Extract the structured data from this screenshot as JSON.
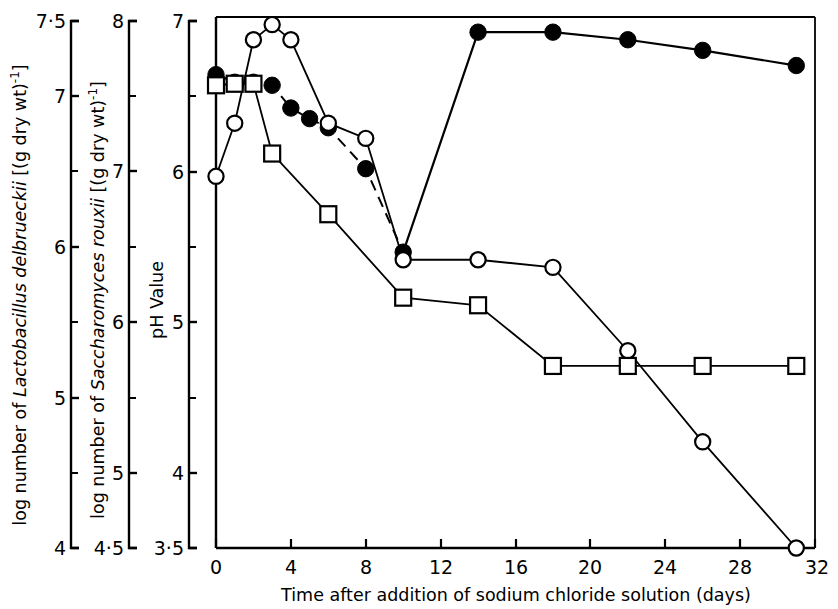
{
  "figure": {
    "background": "#ffffff",
    "ink": "#000000",
    "plot_frame": {
      "left": 216,
      "top": 17,
      "right": 815,
      "bottom": 548
    }
  },
  "axes": {
    "y1": {
      "title_parts": [
        "log number of ",
        "Lactobacillus delbrueckii",
        " [(g dry wt)",
        "-1",
        "]"
      ],
      "title_plain": "log number of Lactobacillus delbrueckii [(g dry wt)-1]",
      "ticks": [
        "7·5",
        "7",
        "6",
        "5",
        "4"
      ],
      "tick_values": [
        7.5,
        7,
        6,
        5,
        4
      ],
      "minor_ticks": [
        6.5,
        5.5,
        4.5
      ],
      "range": [
        4,
        7.5
      ]
    },
    "y2": {
      "title_parts": [
        "log number of ",
        "Saccharomyces rouxii",
        " [(g dry wt)",
        "-1",
        "]"
      ],
      "title_plain": "log number of Saccharomyces rouxii [(g dry wt)-1]",
      "ticks": [
        "8",
        "7",
        "6",
        "5",
        "4·5"
      ],
      "tick_values": [
        8,
        7,
        6,
        5,
        4.5
      ],
      "minor_ticks": [
        7.5,
        6.5,
        5.5
      ],
      "range": [
        4.5,
        8
      ]
    },
    "y3": {
      "title": "pH Value",
      "ticks": [
        "7",
        "6",
        "5",
        "4",
        "3·5"
      ],
      "tick_values": [
        7,
        6,
        5,
        4,
        3.5
      ],
      "minor_ticks": [
        6.5,
        5.5,
        4.5
      ],
      "range": [
        3.5,
        7
      ]
    },
    "x": {
      "title": "Time after addition of sodium chloride solution (days)",
      "ticks": [
        "0",
        "4",
        "8",
        "12",
        "16",
        "20",
        "24",
        "28",
        "32"
      ],
      "tick_values": [
        0,
        4,
        8,
        12,
        16,
        20,
        24,
        28,
        32
      ],
      "range": [
        0,
        32
      ]
    }
  },
  "chart_data": {
    "type": "line",
    "title": "",
    "xlabel": "Time after addition of sodium chloride solution (days)",
    "ylabel": "pH Value / log number of Lactobacillus delbrueckii / log number of Saccharomyces rouxii",
    "xlim": [
      0,
      32
    ],
    "grid": false,
    "legend": "none",
    "series": [
      {
        "name": "pH Value",
        "marker": "filled-circle",
        "line": "solid-with-dashed-segment",
        "axis": "y3",
        "axis_label": "pH Value",
        "x": [
          0,
          1,
          2,
          3,
          4,
          5,
          6,
          8,
          10,
          14,
          18,
          22,
          26,
          31
        ],
        "y": [
          6.62,
          6.57,
          6.57,
          6.55,
          6.4,
          6.33,
          6.27,
          6.0,
          5.45,
          6.9,
          6.9,
          6.85,
          6.78,
          6.68
        ]
      },
      {
        "name": "log number of Saccharomyces rouxii",
        "marker": "open-circle",
        "line": "solid",
        "axis": "y2",
        "axis_label": "log number of Saccharomyces rouxii [(g dry wt)-1]",
        "x": [
          0,
          1,
          2,
          3,
          4,
          6,
          8,
          10,
          14,
          18,
          22,
          26,
          31
        ],
        "y": [
          6.95,
          7.3,
          7.85,
          7.95,
          7.85,
          7.3,
          7.2,
          6.4,
          6.4,
          6.35,
          5.8,
          5.2,
          4.5
        ]
      },
      {
        "name": "log number of Lactobacillus delbrueckii",
        "marker": "open-square",
        "line": "solid",
        "axis": "y1",
        "axis_label": "log number of Lactobacillus delbrueckii [(g dry wt)-1]",
        "x": [
          0,
          1,
          2,
          3,
          6,
          10,
          14,
          18,
          22,
          26,
          31
        ],
        "y": [
          7.05,
          7.06,
          7.06,
          6.6,
          6.2,
          5.65,
          5.6,
          5.2,
          5.2,
          5.2,
          5.2
        ]
      }
    ]
  }
}
